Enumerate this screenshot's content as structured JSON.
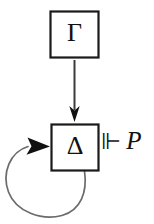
{
  "diagram": {
    "background_color": "#ffffff",
    "ink_color": "#111111",
    "loop_color": "#6b6b6b",
    "nodes": [
      {
        "id": "gamma",
        "label": "Γ",
        "name": "Gamma",
        "shape": "rectangle"
      },
      {
        "id": "delta",
        "label": "Δ",
        "name": "Delta",
        "shape": "rectangle"
      }
    ],
    "edges": [
      {
        "id": "gamma-to-delta",
        "from": "gamma",
        "to": "delta",
        "style": "straight-arrow",
        "direction": "down",
        "label": ""
      },
      {
        "id": "delta-self-loop",
        "from": "delta",
        "to": "delta",
        "style": "self-loop",
        "direction": "counterclockwise",
        "label": ""
      }
    ],
    "judgment": {
      "turnstile": "⊩",
      "turnstile_name": "forces-double-turnstile",
      "formula": "P"
    }
  }
}
